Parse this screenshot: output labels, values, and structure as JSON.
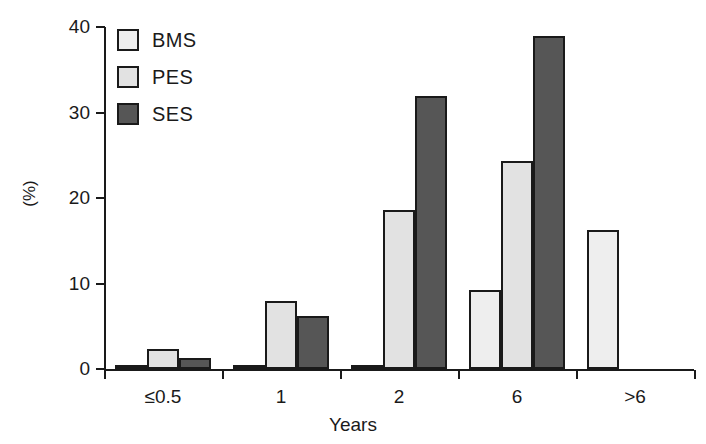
{
  "chart_data": {
    "type": "bar",
    "title": "",
    "subtitle": "",
    "xlabel": "Years",
    "ylabel": "(%)",
    "categories": [
      "≤0.5",
      "1",
      "2",
      "6",
      ">6"
    ],
    "series": [
      {
        "name": "BMS",
        "color": "#eeeeee",
        "values": [
          0.5,
          0.5,
          0.4,
          9.2,
          16.3
        ]
      },
      {
        "name": "PES",
        "color": "#e2e2e2",
        "values": [
          2.3,
          8.0,
          18.6,
          24.3,
          0
        ]
      },
      {
        "name": "SES",
        "color": "#565656",
        "values": [
          1.3,
          6.2,
          31.9,
          38.9,
          0
        ]
      }
    ],
    "ylim": [
      0,
      40
    ],
    "y_ticks": [
      "0",
      "10",
      "20",
      "30",
      "40"
    ],
    "y_tick_values": [
      0,
      10,
      20,
      30,
      40
    ],
    "grid": false,
    "legend_position": "top-left",
    "legend_entries": [
      "BMS",
      "PES",
      "SES"
    ],
    "annotations": [],
    "axis_color": "#1a1a1a",
    "background_color": "#ffffff"
  }
}
